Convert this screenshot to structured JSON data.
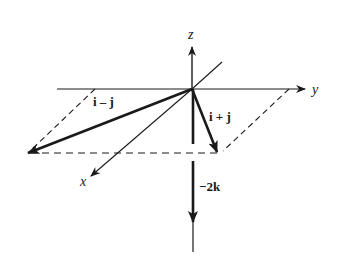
{
  "diagram": {
    "title": "",
    "colors": {
      "ink": "#1a1a1a",
      "background": "#ffffff"
    },
    "axes": {
      "z": {
        "label": "z"
      },
      "y": {
        "label": "y"
      },
      "x": {
        "label": "x"
      }
    },
    "vectors": [
      {
        "id": "i-minus-j",
        "label": "i – j"
      },
      {
        "id": "i-plus-j",
        "label": "i + j"
      },
      {
        "id": "minus-2k",
        "label": "−2k"
      }
    ]
  }
}
